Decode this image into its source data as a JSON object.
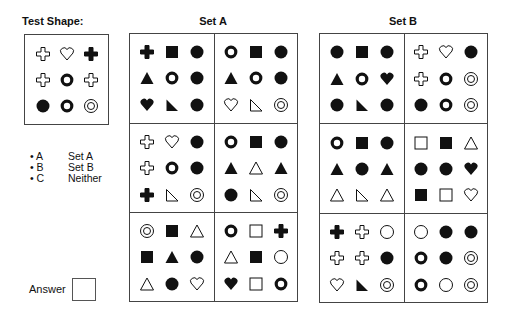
{
  "test": {
    "title": "Test Shape:",
    "shapes": [
      "cross-outline",
      "heart-outline",
      "cross-filled",
      "cross-outline",
      "ring",
      "cross-outline",
      "circle-filled",
      "ring",
      "circle-double"
    ]
  },
  "setA": {
    "title": "Set A",
    "panels": [
      [
        "cross-filled",
        "square-filled",
        "circle-filled",
        "triangle-filled",
        "ring",
        "circle-filled",
        "heart-filled",
        "rtriangle-filled",
        "circle-filled"
      ],
      [
        "ring",
        "square-filled",
        "circle-filled",
        "triangle-filled",
        "ring",
        "circle-filled",
        "heart-outline",
        "rtriangle-outline",
        "circle-double"
      ],
      [
        "cross-outline",
        "heart-outline",
        "circle-filled",
        "cross-outline",
        "ring",
        "circle-filled",
        "cross-filled",
        "rtriangle-outline",
        "circle-double"
      ],
      [
        "ring",
        "square-filled",
        "circle-filled",
        "triangle-filled",
        "triangle-outline",
        "triangle-filled",
        "circle-filled",
        "rtriangle-outline",
        "circle-double"
      ],
      [
        "circle-double",
        "square-filled",
        "triangle-outline",
        "square-filled",
        "triangle-filled",
        "circle-filled",
        "triangle-outline",
        "circle-filled",
        "heart-outline"
      ],
      [
        "ring",
        "square-outline",
        "cross-filled",
        "triangle-outline",
        "square-filled",
        "circle-outline",
        "heart-filled",
        "square-outline",
        "ring"
      ]
    ]
  },
  "setB": {
    "title": "Set B",
    "panels": [
      [
        "circle-filled",
        "square-filled",
        "circle-filled",
        "triangle-filled",
        "ring",
        "heart-filled",
        "circle-filled",
        "rtriangle-filled",
        "circle-filled"
      ],
      [
        "cross-outline",
        "heart-outline",
        "circle-filled",
        "cross-outline",
        "ring",
        "circle-double",
        "circle-filled",
        "ring",
        "circle-double"
      ],
      [
        "ring",
        "square-filled",
        "circle-filled",
        "triangle-filled",
        "circle-filled",
        "triangle-filled",
        "triangle-outline",
        "rtriangle-outline",
        "triangle-outline"
      ],
      [
        "square-outline",
        "square-filled",
        "triangle-outline",
        "circle-filled",
        "circle-filled",
        "heart-filled",
        "square-filled",
        "square-outline",
        "heart-outline"
      ],
      [
        "cross-filled",
        "cross-outline",
        "circle-outline",
        "cross-outline",
        "cross-outline",
        "circle-filled",
        "heart-outline",
        "rtriangle-filled",
        "circle-double"
      ],
      [
        "circle-outline",
        "circle-filled",
        "circle-filled",
        "ring",
        "circle-filled",
        "circle-double",
        "ring",
        "circle-outline",
        "circle-double"
      ]
    ]
  },
  "options": [
    {
      "key": "• A",
      "label": "Set A"
    },
    {
      "key": "• B",
      "label": "Set B"
    },
    {
      "key": "• C",
      "label": "Neither"
    }
  ],
  "answer": {
    "label": "Answer",
    "value": ""
  }
}
